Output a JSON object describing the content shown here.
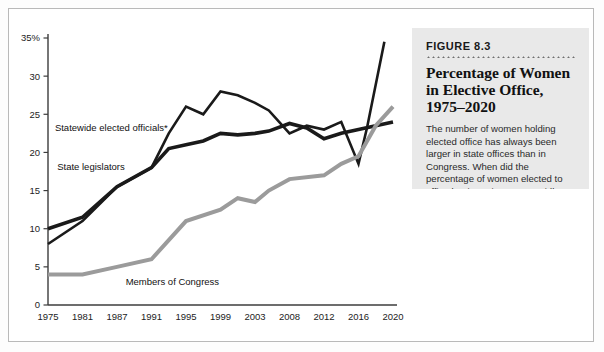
{
  "caption": {
    "figure_number": "FIGURE 8.3",
    "title_line_1": "Percentage of Women",
    "title_line_2": "in Elective Office,",
    "title_line_3": "1975–2020",
    "body": "The number of women holding elected office has always been larger in state offices than in Congress. When did the percentage of women elected to office begin to rise more rapidly?"
  },
  "chart_data": {
    "type": "line",
    "title": "Percentage of Women in Elective Office, 1975–2020",
    "xlabel": "",
    "ylabel": "",
    "ylim": [
      0,
      35
    ],
    "xlim": [
      1975,
      2020
    ],
    "grid": false,
    "legend": "inline-labels",
    "y_ticks": [
      "0",
      "5",
      "10",
      "15",
      "20",
      "25",
      "30",
      "35%"
    ],
    "y_tick_values": [
      0,
      5,
      10,
      15,
      20,
      25,
      30,
      35
    ],
    "x_ticks": [
      "1975",
      "1981",
      "1987",
      "1991",
      "1995",
      "1999",
      "2003",
      "2008",
      "2012",
      "2016",
      "2020"
    ],
    "x_tick_values": [
      1975,
      1981,
      1987,
      1991,
      1995,
      1999,
      2003,
      2008,
      2012,
      2016,
      2020
    ],
    "series": [
      {
        "name": "Statewide elected officials*",
        "color": "#1a1a1a",
        "width": 2.6,
        "label_x": 1976.2,
        "label_y": 23.2,
        "x": [
          1975,
          1981,
          1987,
          1991,
          1993,
          1995,
          1997,
          1999,
          2001,
          2003,
          2005,
          2008,
          2010,
          2012,
          2014,
          2016,
          2017,
          2019
        ],
        "values": [
          8.0,
          11.0,
          15.5,
          18.0,
          22.5,
          26.0,
          25.0,
          28.0,
          27.5,
          26.5,
          25.5,
          22.5,
          23.5,
          23.0,
          24.0,
          18.5,
          23.3,
          34.5
        ]
      },
      {
        "name": "State legislators",
        "color": "#1a1a1a",
        "width": 3.6,
        "label_x": 1976.6,
        "label_y": 18.1,
        "x": [
          1975,
          1981,
          1987,
          1991,
          1993,
          1995,
          1997,
          1999,
          2001,
          2003,
          2005,
          2008,
          2010,
          2012,
          2014,
          2016,
          2018,
          2020
        ],
        "values": [
          10.0,
          11.5,
          15.5,
          18.0,
          20.5,
          21.0,
          21.5,
          22.5,
          22.3,
          22.5,
          22.8,
          23.8,
          23.2,
          21.8,
          22.5,
          23.0,
          23.5,
          24.0
        ]
      },
      {
        "name": "Members of Congress",
        "color": "#9b9b9b",
        "width": 4.0,
        "label_x": 1988.0,
        "label_y": 3.1,
        "x": [
          1975,
          1981,
          1987,
          1991,
          1995,
          1999,
          2001,
          2003,
          2005,
          2008,
          2012,
          2014,
          2016,
          2018,
          2020
        ],
        "values": [
          4.0,
          4.0,
          5.0,
          6.0,
          11.0,
          12.5,
          14.0,
          13.5,
          15.0,
          16.5,
          17.0,
          18.5,
          19.5,
          23.5,
          26.0
        ]
      }
    ],
    "footnote_marker": "*"
  }
}
